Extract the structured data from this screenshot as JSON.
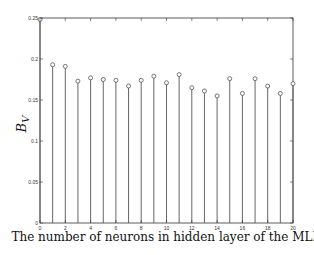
{
  "chart_data": {
    "type": "stem",
    "title": "",
    "xlabel": "The number of neurons in hidden layer of the MLP",
    "ylabel": "B",
    "ylabel_subscript": "V",
    "xlim": [
      0,
      20
    ],
    "ylim": [
      0,
      0.25
    ],
    "xticks": [
      0,
      2,
      4,
      6,
      8,
      10,
      12,
      14,
      16,
      18,
      20
    ],
    "yticks": [
      0,
      0.05,
      0.1,
      0.15,
      0.2,
      0.25
    ],
    "ytick_labels": [
      "0",
      "0.05",
      "0.1",
      "0.15",
      "0.2",
      "0.25"
    ],
    "grid": false,
    "legend": "none",
    "x": [
      0,
      1,
      2,
      3,
      4,
      5,
      6,
      7,
      8,
      9,
      10,
      11,
      12,
      13,
      14,
      15,
      16,
      17,
      18,
      19,
      20
    ],
    "values": [
      0.248,
      0.193,
      0.191,
      0.173,
      0.177,
      0.175,
      0.174,
      0.167,
      0.174,
      0.179,
      0.171,
      0.181,
      0.165,
      0.161,
      0.155,
      0.176,
      0.158,
      0.176,
      0.167,
      0.158,
      0.17
    ],
    "colors": {
      "stem": "#555555",
      "marker": "#555555",
      "axis": "#333333"
    }
  }
}
